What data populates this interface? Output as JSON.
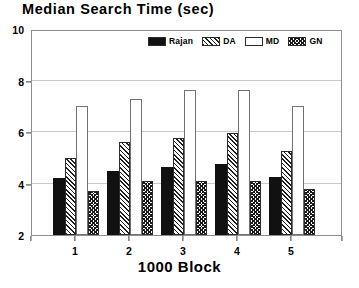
{
  "chart_data": {
    "type": "bar",
    "title": "Median Search Time (sec)",
    "xlabel": "1000 Block",
    "ylabel": "",
    "categories": [
      "1",
      "2",
      "3",
      "4",
      "5"
    ],
    "ylim": [
      2,
      10
    ],
    "yticks": [
      2,
      4,
      6,
      8,
      10
    ],
    "ytick_labels": [
      "2",
      "4",
      "6",
      "8",
      "10"
    ],
    "gridlines": [
      4,
      6,
      8
    ],
    "grid": true,
    "legend_position": "top-center-inside",
    "series": [
      {
        "name": "Rajan",
        "pattern": "solid-black",
        "color": "#111111",
        "values": [
          4.2,
          4.5,
          4.65,
          4.75,
          4.25
        ]
      },
      {
        "name": "DA",
        "pattern": "diagonal-hatch",
        "color": "#1f1f1f",
        "values": [
          5.0,
          5.6,
          5.75,
          5.95,
          5.25
        ]
      },
      {
        "name": "MD",
        "pattern": "empty-white",
        "color": "#ffffff",
        "values": [
          7.0,
          7.3,
          7.65,
          7.65,
          7.0
        ]
      },
      {
        "name": "GN",
        "pattern": "cross-stipple",
        "color": "#1a1a1a",
        "values": [
          3.7,
          4.1,
          4.1,
          4.1,
          3.8
        ]
      }
    ]
  }
}
